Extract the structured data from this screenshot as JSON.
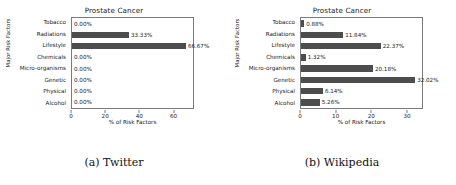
{
  "figure": {
    "subfigures": [
      {
        "caption": "(a) Twitter",
        "title": "Prostate Cancer",
        "ylabel": "Major Risk Factors",
        "xlabel": "% of Risk Factors"
      },
      {
        "caption": "(b) Wikipedia",
        "title": "Prostate Cancer",
        "ylabel": "Major Risk Factors",
        "xlabel": "% of Risk Factors"
      }
    ]
  },
  "chart_data": [
    {
      "type": "bar",
      "orientation": "horizontal",
      "title": "Prostate Cancer",
      "subfigure_caption": "(a) Twitter",
      "xlabel": "% of Risk Factors",
      "ylabel": "Major Risk Factors",
      "categories": [
        "Tobacco",
        "Radiations",
        "Lifestyle",
        "Chemicals",
        "Micro-organisms",
        "Genetic",
        "Physical",
        "Alcohol"
      ],
      "values": [
        0.0,
        33.33,
        66.67,
        0.0,
        0.0,
        0.0,
        0.0,
        0.0
      ],
      "value_labels": [
        "0.00%",
        "33.33%",
        "66.67%",
        "0.00%",
        "0.00%",
        "0.00%",
        "0.00%",
        "0.00%"
      ],
      "xticks": [
        0,
        20,
        40,
        60
      ],
      "xtick_labels": [
        "0",
        "20",
        "40",
        "60"
      ],
      "xlim": [
        0,
        72
      ],
      "grid": false,
      "legend": null,
      "bar_color": "#4d4d4d"
    },
    {
      "type": "bar",
      "orientation": "horizontal",
      "title": "Prostate Cancer",
      "subfigure_caption": "(b) Wikipedia",
      "xlabel": "% of Risk Factors",
      "ylabel": "Major Risk Factors",
      "categories": [
        "Tobacco",
        "Radiations",
        "Lifestyle",
        "Chemicals",
        "Micro-organisms",
        "Genetic",
        "Physical",
        "Alcohol"
      ],
      "values": [
        0.88,
        11.84,
        22.37,
        1.32,
        20.18,
        32.02,
        6.14,
        5.26
      ],
      "value_labels": [
        "0.88%",
        "11.84%",
        "22.37%",
        "1.32%",
        "20.18%",
        "32.02%",
        "6.14%",
        "5.26%"
      ],
      "xticks": [
        0,
        10,
        20,
        30
      ],
      "xtick_labels": [
        "0",
        "10",
        "20",
        "30"
      ],
      "xlim": [
        0,
        34.5
      ],
      "grid": false,
      "legend": null,
      "bar_color": "#4d4d4d"
    }
  ]
}
